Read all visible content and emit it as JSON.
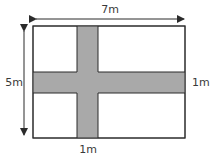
{
  "diagram": {
    "width_label": "7m",
    "height_label": "5m",
    "horizontal_path_width_label": "1m",
    "vertical_path_width_label": "1m",
    "colors": {
      "path_fill": "#a9a9a9",
      "outline": "#2b2b2b",
      "background": "#ffffff"
    }
  }
}
